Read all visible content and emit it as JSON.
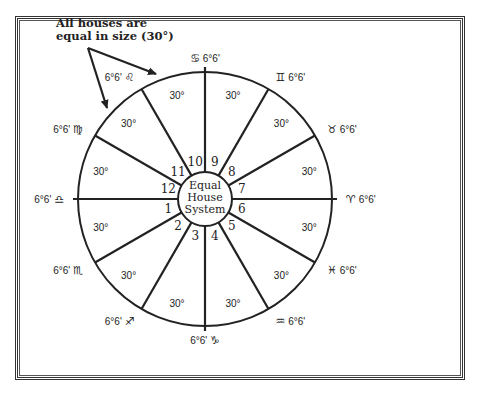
{
  "diagram": {
    "title": "Equal House System",
    "center_label_lines": [
      "Equal",
      "House",
      "System"
    ],
    "annotation": {
      "line1": "All houses are",
      "line2": "equal in size (30°)"
    },
    "house_size": "30°",
    "houses": [
      {
        "number": "1",
        "span": "30°"
      },
      {
        "number": "2",
        "span": "30°"
      },
      {
        "number": "3",
        "span": "30°"
      },
      {
        "number": "4",
        "span": "30°"
      },
      {
        "number": "5",
        "span": "30°"
      },
      {
        "number": "6",
        "span": "30°"
      },
      {
        "number": "7",
        "span": "30°"
      },
      {
        "number": "8",
        "span": "30°"
      },
      {
        "number": "9",
        "span": "30°"
      },
      {
        "number": "10",
        "span": "30°"
      },
      {
        "number": "11",
        "span": "30°"
      },
      {
        "number": "12",
        "span": "30°"
      }
    ],
    "cusps": [
      {
        "sign": "Libra",
        "glyph": "♎",
        "degree": "6°6'"
      },
      {
        "sign": "Scorpio",
        "glyph": "♏",
        "degree": "6°6'"
      },
      {
        "sign": "Sagittarius",
        "glyph": "♐",
        "degree": "6°6'"
      },
      {
        "sign": "Capricorn",
        "glyph": "♑",
        "degree": "6°6'"
      },
      {
        "sign": "Aquarius",
        "glyph": "♒",
        "degree": "6°6'"
      },
      {
        "sign": "Pisces",
        "glyph": "♓",
        "degree": "6°6'"
      },
      {
        "sign": "Aries",
        "glyph": "♈",
        "degree": "6°6'"
      },
      {
        "sign": "Taurus",
        "glyph": "♉",
        "degree": "6°6'"
      },
      {
        "sign": "Gemini",
        "glyph": "♊",
        "degree": "6°6'"
      },
      {
        "sign": "Cancer",
        "glyph": "♋",
        "degree": "6°6'"
      },
      {
        "sign": "Leo",
        "glyph": "♌",
        "degree": "6°6'"
      },
      {
        "sign": "Virgo",
        "glyph": "♍",
        "degree": "6°6'"
      }
    ]
  }
}
